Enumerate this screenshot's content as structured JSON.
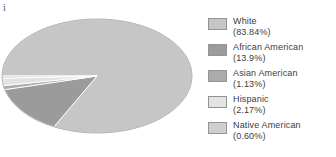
{
  "artifact": {
    "glyph": "i"
  },
  "chart_data": {
    "type": "pie",
    "title": "",
    "subtitle": "",
    "xlabel": "",
    "ylabel": "",
    "style": "3d-pie",
    "legend_position": "right",
    "grid": false,
    "start_angle_deg": 180,
    "direction": "clockwise",
    "categories": [
      "White",
      "African American",
      "Asian American",
      "Hispanic",
      "Native American"
    ],
    "values": [
      83.84,
      13.9,
      1.13,
      2.17,
      0.6
    ],
    "value_unit": "%",
    "value_labels": [
      "(83.84%)",
      "(13.9%)",
      "(1.13%)",
      "(2.17%)",
      "(0.60%)"
    ],
    "colors": [
      "#c6c6c6",
      "#9b9b9b",
      "#ababab",
      "#e3e3e3",
      "#cfcfcf"
    ],
    "side_colors": [
      "#b7b7b7",
      "#8d8d8d",
      "#9d9d9d",
      "#d4d4d4",
      "#c0c0c0"
    ],
    "edge_color": "#8f8f8f"
  },
  "legend": {
    "items": [
      {
        "label": "White",
        "value": "(83.84%)",
        "color": "#c6c6c6"
      },
      {
        "label": "African American",
        "value": "(13.9%)",
        "color": "#9b9b9b"
      },
      {
        "label": "Asian American",
        "value": "(1.13%)",
        "color": "#ababab"
      },
      {
        "label": "Hispanic",
        "value": "(2.17%)",
        "color": "#e3e3e3"
      },
      {
        "label": "Native American",
        "value": "(0.60%)",
        "color": "#cfcfcf"
      }
    ]
  }
}
